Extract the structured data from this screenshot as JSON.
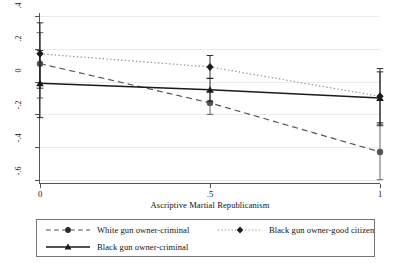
{
  "chart_data": {
    "type": "line",
    "title": "",
    "xlabel": "Ascriptive Martial Republicanism",
    "ylabel": "Effects on Linear Prediction",
    "xlim": [
      0,
      1
    ],
    "ylim": [
      -0.62,
      0.42
    ],
    "x": [
      0,
      0.5,
      1
    ],
    "xticks": [
      "0",
      ".5",
      "1"
    ],
    "yticks": [
      ".4",
      ".2",
      "0",
      "-.2",
      "-.4",
      "-.6"
    ],
    "ytickvals": [
      0.4,
      0.2,
      0,
      -0.2,
      -0.4,
      -0.6
    ],
    "grid": true,
    "legend_position": "bottom",
    "series": [
      {
        "name": "White gun owner-criminal",
        "marker": "circle",
        "linestyle": "dashed",
        "color": "#555555",
        "values": [
          0.11,
          -0.13,
          -0.43
        ],
        "ci_low": [
          -0.1,
          -0.2,
          -0.6
        ],
        "ci_high": [
          0.3,
          -0.06,
          -0.25
        ]
      },
      {
        "name": "Black gun owner-criminal",
        "marker": "triangle",
        "linestyle": "solid",
        "color": "#1a1a1a",
        "values": [
          -0.01,
          -0.05,
          -0.1
        ],
        "ci_low": [
          -0.22,
          -0.12,
          -0.27
        ],
        "ci_high": [
          0.19,
          0.02,
          0.06
        ]
      },
      {
        "name": "Black gun owner-good citizen",
        "marker": "diamond",
        "linestyle": "dotted",
        "color": "#1a1a1a",
        "values": [
          0.17,
          0.09,
          -0.09
        ],
        "ci_low": [
          -0.04,
          0.02,
          -0.26
        ],
        "ci_high": [
          0.36,
          0.16,
          0.08
        ]
      }
    ]
  },
  "legend": {
    "items": [
      {
        "label": "White gun owner-criminal"
      },
      {
        "label": "Black gun owner-good citizen"
      },
      {
        "label": "Black gun owner-criminal"
      }
    ]
  }
}
